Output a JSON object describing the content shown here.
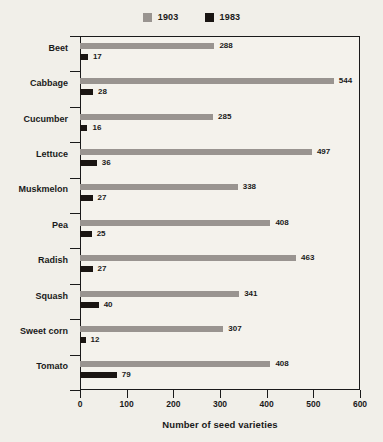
{
  "chart_data": {
    "type": "bar",
    "orientation": "horizontal",
    "title": "",
    "xlabel": "Number of seed varieties",
    "ylabel": "",
    "xlim": [
      0,
      600
    ],
    "xticks": [
      0,
      100,
      200,
      300,
      400,
      500,
      600
    ],
    "grid": false,
    "legend_position": "top-center",
    "categories": [
      "Beet",
      "Cabbage",
      "Cucumber",
      "Lettuce",
      "Muskmelon",
      "Pea",
      "Radish",
      "Squash",
      "Sweet corn",
      "Tomato"
    ],
    "series": [
      {
        "name": "1903",
        "color": "#999490",
        "values": [
          288,
          544,
          285,
          497,
          338,
          408,
          463,
          341,
          307,
          408
        ]
      },
      {
        "name": "1983",
        "color": "#1a1512",
        "values": [
          17,
          28,
          16,
          36,
          27,
          25,
          27,
          40,
          12,
          79
        ]
      }
    ]
  },
  "legend": {
    "entries": [
      {
        "label": "1903",
        "color": "#999490",
        "swatch_name": "legend-swatch-1903"
      },
      {
        "label": "1983",
        "color": "#1a1512",
        "swatch_name": "legend-swatch-1983"
      }
    ]
  },
  "axis": {
    "x_title": "Number of seed varieties",
    "x_tick_labels": [
      "0",
      "100",
      "200",
      "300",
      "400",
      "500",
      "600"
    ]
  },
  "colors": {
    "background": "#f1efe9",
    "plot_background": "#f4f2ec",
    "axis": "#1a1a1a",
    "series_1903": "#999490",
    "series_1983": "#1a1512"
  }
}
